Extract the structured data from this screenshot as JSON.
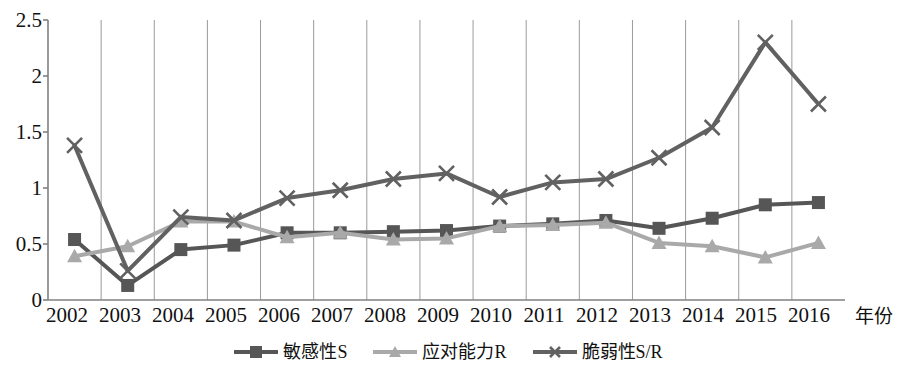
{
  "chart_data": {
    "type": "line",
    "title": "",
    "xlabel": "年份",
    "ylabel": "",
    "grid": "vertical",
    "legend_position": "bottom",
    "xlim": [
      2002,
      2016
    ],
    "ylim": [
      0,
      2.5
    ],
    "y_ticks": [
      "0",
      "0.5",
      "1",
      "1.5",
      "2",
      "2.5"
    ],
    "y_tick_values": [
      0,
      0.5,
      1,
      1.5,
      2,
      2.5
    ],
    "categories": [
      "2002",
      "2003",
      "2004",
      "2005",
      "2006",
      "2007",
      "2008",
      "2009",
      "2010",
      "2011",
      "2012",
      "2013",
      "2014",
      "2015",
      "2016"
    ],
    "series": [
      {
        "name": "敏感性S",
        "marker": "square",
        "color": "#565656",
        "values": [
          0.54,
          0.13,
          0.45,
          0.49,
          0.6,
          0.6,
          0.61,
          0.62,
          0.66,
          0.68,
          0.71,
          0.64,
          0.73,
          0.85,
          0.87
        ]
      },
      {
        "name": "应对能力R",
        "marker": "triangle",
        "color": "#a9a9a9",
        "values": [
          0.39,
          0.48,
          0.7,
          0.7,
          0.56,
          0.6,
          0.54,
          0.55,
          0.66,
          0.67,
          0.69,
          0.51,
          0.48,
          0.38,
          0.51
        ]
      },
      {
        "name": "脆弱性S/R",
        "marker": "x",
        "color": "#616161",
        "values": [
          1.38,
          0.26,
          0.74,
          0.71,
          0.91,
          0.98,
          1.08,
          1.13,
          0.92,
          1.05,
          1.08,
          1.27,
          1.54,
          2.3,
          1.75
        ]
      }
    ]
  },
  "axis": {
    "frame_color": "#808080",
    "gridline_color": "#9a9a9a"
  }
}
